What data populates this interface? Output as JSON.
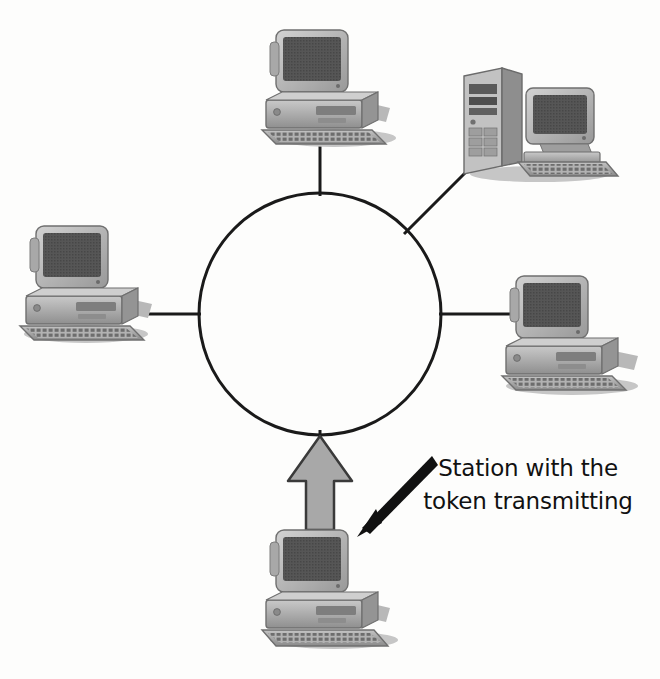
{
  "figure": {
    "background_color": "#fdfdfc",
    "line_color": "#1a1a1a",
    "device_body_color": "#b0b0b0",
    "device_shadow_color": "#7a7a7a",
    "screen_color": "#555555",
    "token_arrow_fill": "#a8a8a8"
  },
  "ring": {
    "name": "token-ring",
    "center_x": 320,
    "center_y": 314,
    "radius": 121,
    "stroke_width": 3
  },
  "nodes": [
    {
      "id": "top",
      "label": "workstation-top",
      "type": "desktop-computer",
      "x": 252,
      "y": 22
    },
    {
      "id": "top-right",
      "label": "server-top-right",
      "type": "tower-server",
      "x": 448,
      "y": 62
    },
    {
      "id": "left",
      "label": "workstation-left",
      "type": "desktop-computer",
      "x": 12,
      "y": 218
    },
    {
      "id": "right",
      "label": "workstation-right",
      "type": "desktop-computer",
      "x": 488,
      "y": 262
    },
    {
      "id": "bottom",
      "label": "workstation-bottom-token-holder",
      "type": "desktop-computer",
      "x": 252,
      "y": 522
    }
  ],
  "links": [
    {
      "name": "link-top",
      "from": "ring",
      "to": "top"
    },
    {
      "name": "link-top-right",
      "from": "ring",
      "to": "top-right"
    },
    {
      "name": "link-left",
      "from": "ring",
      "to": "left"
    },
    {
      "name": "link-right",
      "from": "ring",
      "to": "right"
    },
    {
      "name": "link-bottom",
      "from": "ring",
      "to": "bottom"
    }
  ],
  "token_arrow": {
    "name": "token-transmission-arrow",
    "direction": "up",
    "from_node": "bottom",
    "to": "ring"
  },
  "callout": {
    "line_1": "Station with the",
    "line_2": "token transmitting",
    "arrow_target": "workstation-bottom-token-holder"
  }
}
